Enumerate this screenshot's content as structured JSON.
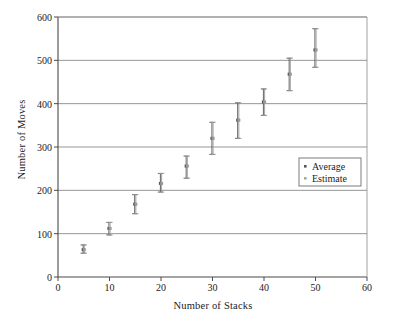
{
  "chart_data": {
    "type": "scatter",
    "title": "",
    "xlabel": "Number of Stacks",
    "ylabel": "Number of Moves",
    "xlim": [
      0,
      60
    ],
    "ylim": [
      0,
      600
    ],
    "xticks": [
      0,
      10,
      20,
      30,
      40,
      50,
      60
    ],
    "yticks": [
      0,
      100,
      200,
      300,
      400,
      500,
      600
    ],
    "xtick_labels": [
      "0",
      "10",
      "20",
      "30",
      "40",
      "50",
      "60"
    ],
    "ytick_labels": [
      "0",
      "100",
      "200",
      "300",
      "400",
      "500",
      "600"
    ],
    "grid": "horizontal",
    "legend_position": "center-right",
    "x": [
      5,
      10,
      15,
      20,
      25,
      30,
      35,
      40,
      45,
      50
    ],
    "series": [
      {
        "name": "Average",
        "marker": "point-dark",
        "color": "#555555",
        "values": [
          63,
          112,
          168,
          216,
          256,
          320,
          362,
          404,
          468,
          524
        ],
        "err_low": [
          55,
          97,
          146,
          196,
          228,
          283,
          320,
          373,
          430,
          484
        ],
        "err_high": [
          74,
          126,
          190,
          239,
          279,
          357,
          402,
          434,
          505,
          573
        ]
      },
      {
        "name": "Estimate",
        "marker": "point-light",
        "color": "#9a9a9a",
        "values": [
          63,
          112,
          168,
          216,
          256,
          320,
          362,
          404,
          468,
          524
        ],
        "err_low": [
          55,
          97,
          146,
          196,
          228,
          283,
          320,
          373,
          430,
          484
        ],
        "err_high": [
          74,
          126,
          190,
          239,
          279,
          357,
          402,
          434,
          505,
          573
        ]
      }
    ],
    "legend_entries": [
      {
        "label": "Average",
        "marker_color": "#555555"
      },
      {
        "label": "Estimate",
        "marker_color": "#a8a8a8"
      }
    ],
    "colors": {
      "axis": "#4a4a4a",
      "grid": "#8a8a8a",
      "average": "#555555",
      "estimate": "#a8a8a8",
      "background": "#ffffff",
      "text": "#1c1c1c"
    }
  }
}
